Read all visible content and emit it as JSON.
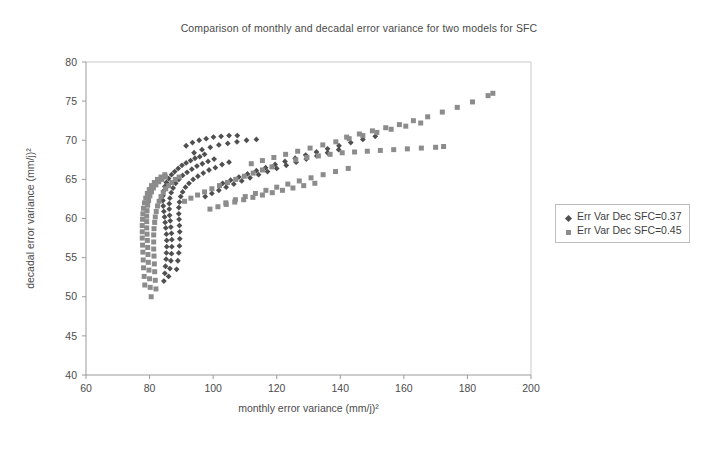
{
  "chart_data": {
    "type": "scatter",
    "title": "Comparison of monthly and decadal error variance for two models for SFC",
    "xlabel": "monthly error variance (mm/j)²",
    "ylabel": "decadal error variance (mm/j)²",
    "xlim": [
      60,
      200
    ],
    "ylim": [
      40,
      80
    ],
    "xticks": [
      60,
      80,
      100,
      120,
      140,
      160,
      180,
      200
    ],
    "yticks": [
      40,
      45,
      50,
      55,
      60,
      65,
      70,
      75,
      80
    ],
    "grid": false,
    "legend_position": "right",
    "series": [
      {
        "name": "Err Var Dec SFC=0.37",
        "marker": "diamond",
        "color": "#4f4f4f",
        "points": [
          [
            84.5,
            52.0
          ],
          [
            84.8,
            53.0
          ],
          [
            85.0,
            53.9
          ],
          [
            85.2,
            54.8
          ],
          [
            85.3,
            55.6
          ],
          [
            85.4,
            56.4
          ],
          [
            85.4,
            57.2
          ],
          [
            85.3,
            58.0
          ],
          [
            85.1,
            58.8
          ],
          [
            84.9,
            59.5
          ],
          [
            84.7,
            60.2
          ],
          [
            84.5,
            60.9
          ],
          [
            84.3,
            61.6
          ],
          [
            84.2,
            62.3
          ],
          [
            84.2,
            62.9
          ],
          [
            84.4,
            63.5
          ],
          [
            84.8,
            64.1
          ],
          [
            85.3,
            64.6
          ],
          [
            86.0,
            65.1
          ],
          [
            86.9,
            65.6
          ],
          [
            87.9,
            66.0
          ],
          [
            89.0,
            66.4
          ],
          [
            90.2,
            66.8
          ],
          [
            91.5,
            67.1
          ],
          [
            92.9,
            67.4
          ],
          [
            94.3,
            67.7
          ],
          [
            95.8,
            67.9
          ],
          [
            97.3,
            68.2
          ],
          [
            86.0,
            52.6
          ],
          [
            86.4,
            53.6
          ],
          [
            86.7,
            54.6
          ],
          [
            86.9,
            55.5
          ],
          [
            87.0,
            56.4
          ],
          [
            87.0,
            57.3
          ],
          [
            86.9,
            58.1
          ],
          [
            86.7,
            58.9
          ],
          [
            86.5,
            59.7
          ],
          [
            86.3,
            60.4
          ],
          [
            86.2,
            61.2
          ],
          [
            86.2,
            61.9
          ],
          [
            86.4,
            62.6
          ],
          [
            86.8,
            63.3
          ],
          [
            87.4,
            63.9
          ],
          [
            88.2,
            64.5
          ],
          [
            89.2,
            65.0
          ],
          [
            90.4,
            65.5
          ],
          [
            91.8,
            65.9
          ],
          [
            93.3,
            66.3
          ],
          [
            94.9,
            66.7
          ],
          [
            96.6,
            67.0
          ],
          [
            98.4,
            67.3
          ],
          [
            100.3,
            67.6
          ],
          [
            88.5,
            53.5
          ],
          [
            88.9,
            54.6
          ],
          [
            89.2,
            55.6
          ],
          [
            89.4,
            56.5
          ],
          [
            89.5,
            57.4
          ],
          [
            89.5,
            58.3
          ],
          [
            89.4,
            59.1
          ],
          [
            89.3,
            59.9
          ],
          [
            89.2,
            60.6
          ],
          [
            89.2,
            61.4
          ],
          [
            89.4,
            62.1
          ],
          [
            89.8,
            62.8
          ],
          [
            90.4,
            63.4
          ],
          [
            91.3,
            64.0
          ],
          [
            92.4,
            64.5
          ],
          [
            93.7,
            65.0
          ],
          [
            95.2,
            65.4
          ],
          [
            96.9,
            65.8
          ],
          [
            98.7,
            66.2
          ],
          [
            100.7,
            66.5
          ],
          [
            102.8,
            66.9
          ],
          [
            105.0,
            67.2
          ],
          [
            97.5,
            62.8
          ],
          [
            99.6,
            63.2
          ],
          [
            101.8,
            63.6
          ],
          [
            104.1,
            64.0
          ],
          [
            106.5,
            64.4
          ],
          [
            109.0,
            64.8
          ],
          [
            111.6,
            65.2
          ],
          [
            114.3,
            65.6
          ],
          [
            117.1,
            66.0
          ],
          [
            120.0,
            66.4
          ],
          [
            123.0,
            66.8
          ],
          [
            126.1,
            67.2
          ],
          [
            129.3,
            67.6
          ],
          [
            132.6,
            68.0
          ],
          [
            136.0,
            68.4
          ],
          [
            139.5,
            68.8
          ],
          [
            103.0,
            64.5
          ],
          [
            105.5,
            64.9
          ],
          [
            108.1,
            65.3
          ],
          [
            110.8,
            65.7
          ],
          [
            113.6,
            66.1
          ],
          [
            116.5,
            66.5
          ],
          [
            119.5,
            66.9
          ],
          [
            122.6,
            67.3
          ],
          [
            125.8,
            67.7
          ],
          [
            129.1,
            68.1
          ],
          [
            132.5,
            68.5
          ],
          [
            136.0,
            68.9
          ],
          [
            139.6,
            69.3
          ],
          [
            143.3,
            69.7
          ],
          [
            147.1,
            70.1
          ],
          [
            151.0,
            70.5
          ],
          [
            94.0,
            68.4
          ],
          [
            96.5,
            68.8
          ],
          [
            99.1,
            69.1
          ],
          [
            101.8,
            69.4
          ],
          [
            104.6,
            69.6
          ],
          [
            107.5,
            69.8
          ],
          [
            110.5,
            70.0
          ],
          [
            113.6,
            70.1
          ],
          [
            91.5,
            69.3
          ],
          [
            93.5,
            69.7
          ],
          [
            95.6,
            70.0
          ],
          [
            97.8,
            70.2
          ],
          [
            100.1,
            70.4
          ],
          [
            102.5,
            70.5
          ],
          [
            105.0,
            70.6
          ],
          [
            107.6,
            70.6
          ]
        ]
      },
      {
        "name": "Err Var Dec SFC=0.45",
        "marker": "square",
        "color": "#8c8c8c",
        "points": [
          [
            80.5,
            50.0
          ],
          [
            80.2,
            51.2
          ],
          [
            80.0,
            52.3
          ],
          [
            79.8,
            53.4
          ],
          [
            79.6,
            54.4
          ],
          [
            79.5,
            55.4
          ],
          [
            79.4,
            56.3
          ],
          [
            79.3,
            57.2
          ],
          [
            79.2,
            58.0
          ],
          [
            79.1,
            58.8
          ],
          [
            79.1,
            59.6
          ],
          [
            79.1,
            60.3
          ],
          [
            79.2,
            61.0
          ],
          [
            79.4,
            61.7
          ],
          [
            79.7,
            62.3
          ],
          [
            80.1,
            62.9
          ],
          [
            80.6,
            63.4
          ],
          [
            81.2,
            63.9
          ],
          [
            82.0,
            64.3
          ],
          [
            82.9,
            64.7
          ],
          [
            83.9,
            65.0
          ],
          [
            85.0,
            65.3
          ],
          [
            78.5,
            51.5
          ],
          [
            78.3,
            52.6
          ],
          [
            78.1,
            53.7
          ],
          [
            78.0,
            54.7
          ],
          [
            77.9,
            55.7
          ],
          [
            77.8,
            56.6
          ],
          [
            77.7,
            57.5
          ],
          [
            77.7,
            58.3
          ],
          [
            77.7,
            59.1
          ],
          [
            77.8,
            59.9
          ],
          [
            77.9,
            60.6
          ],
          [
            78.1,
            61.3
          ],
          [
            78.4,
            62.0
          ],
          [
            78.8,
            62.6
          ],
          [
            79.3,
            63.2
          ],
          [
            79.9,
            63.7
          ],
          [
            80.6,
            64.2
          ],
          [
            81.5,
            64.6
          ],
          [
            82.5,
            65.0
          ],
          [
            83.6,
            65.3
          ],
          [
            84.8,
            65.6
          ],
          [
            82.0,
            51.0
          ],
          [
            81.8,
            52.1
          ],
          [
            81.6,
            53.2
          ],
          [
            81.5,
            54.2
          ],
          [
            81.4,
            55.2
          ],
          [
            81.3,
            56.1
          ],
          [
            81.3,
            57.0
          ],
          [
            81.3,
            57.9
          ],
          [
            81.4,
            58.7
          ],
          [
            81.6,
            59.5
          ],
          [
            81.8,
            60.2
          ],
          [
            82.1,
            60.9
          ],
          [
            82.5,
            61.6
          ],
          [
            83.0,
            62.2
          ],
          [
            83.6,
            62.8
          ],
          [
            84.3,
            63.3
          ],
          [
            85.1,
            63.8
          ],
          [
            86.0,
            64.2
          ],
          [
            87.0,
            64.6
          ],
          [
            88.1,
            65.0
          ],
          [
            89.3,
            65.3
          ],
          [
            91.0,
            62.2
          ],
          [
            93.0,
            62.6
          ],
          [
            95.1,
            63.0
          ],
          [
            97.3,
            63.4
          ],
          [
            99.6,
            63.8
          ],
          [
            102.0,
            64.2
          ],
          [
            104.5,
            64.6
          ],
          [
            107.1,
            65.0
          ],
          [
            109.8,
            65.4
          ],
          [
            112.6,
            65.8
          ],
          [
            115.5,
            66.2
          ],
          [
            118.5,
            66.6
          ],
          [
            104.0,
            62.0
          ],
          [
            107.0,
            62.4
          ],
          [
            110.1,
            62.8
          ],
          [
            113.3,
            63.2
          ],
          [
            116.6,
            63.6
          ],
          [
            120.0,
            64.0
          ],
          [
            123.5,
            64.4
          ],
          [
            127.1,
            64.8
          ],
          [
            130.8,
            65.2
          ],
          [
            134.6,
            65.6
          ],
          [
            138.5,
            66.0
          ],
          [
            142.5,
            66.4
          ],
          [
            112.0,
            67.0
          ],
          [
            115.5,
            67.4
          ],
          [
            119.1,
            67.8
          ],
          [
            122.8,
            68.2
          ],
          [
            126.6,
            68.6
          ],
          [
            130.5,
            69.0
          ],
          [
            134.5,
            69.4
          ],
          [
            138.6,
            69.8
          ],
          [
            142.8,
            70.2
          ],
          [
            147.1,
            70.6
          ],
          [
            151.5,
            71.0
          ],
          [
            156.0,
            71.4
          ],
          [
            160.6,
            71.8
          ],
          [
            165.3,
            72.2
          ],
          [
            142.0,
            70.4
          ],
          [
            146.0,
            70.8
          ],
          [
            150.1,
            71.2
          ],
          [
            154.3,
            71.6
          ],
          [
            158.6,
            72.0
          ],
          [
            163.0,
            72.5
          ],
          [
            167.5,
            73.0
          ],
          [
            172.1,
            73.6
          ],
          [
            176.8,
            74.2
          ],
          [
            181.6,
            74.9
          ],
          [
            186.5,
            75.7
          ],
          [
            188.0,
            76.0
          ],
          [
            126.0,
            67.5
          ],
          [
            129.5,
            67.8
          ],
          [
            133.1,
            68.0
          ],
          [
            136.8,
            68.2
          ],
          [
            140.6,
            68.4
          ],
          [
            144.5,
            68.5
          ],
          [
            148.5,
            68.6
          ],
          [
            152.6,
            68.7
          ],
          [
            156.8,
            68.8
          ],
          [
            161.1,
            68.9
          ],
          [
            165.5,
            69.0
          ],
          [
            170.0,
            69.1
          ],
          [
            172.5,
            69.2
          ],
          [
            99.0,
            61.2
          ],
          [
            101.5,
            61.5
          ],
          [
            104.1,
            61.8
          ],
          [
            106.8,
            62.1
          ],
          [
            109.6,
            62.4
          ],
          [
            112.5,
            62.7
          ],
          [
            115.5,
            63.0
          ],
          [
            118.6,
            63.3
          ],
          [
            121.8,
            63.6
          ],
          [
            125.1,
            63.9
          ],
          [
            128.5,
            64.2
          ],
          [
            132.0,
            64.5
          ]
        ]
      }
    ]
  }
}
